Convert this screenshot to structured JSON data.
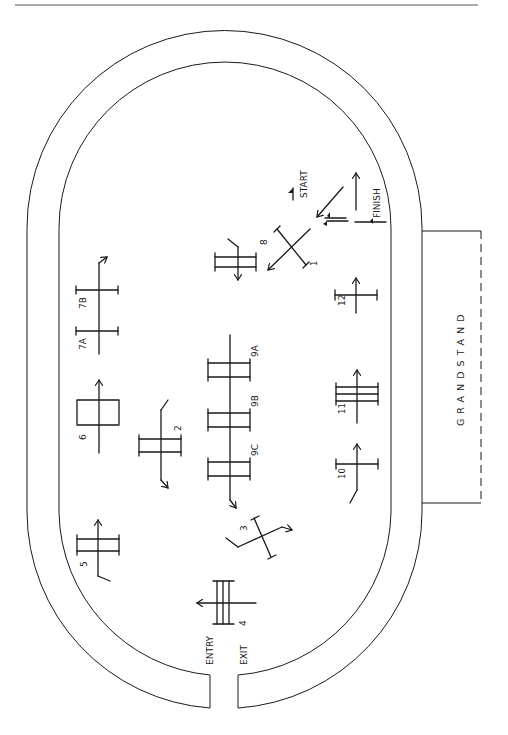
{
  "diagram": {
    "type": "arena-course-plan",
    "features": {
      "grandstand_label": "GRANDSTAND",
      "entry_label": "ENTRY",
      "exit_label": "EXIT",
      "start_label": "START",
      "finish_label": "FINISH"
    },
    "obstacles": [
      {
        "id": "1",
        "label": "1"
      },
      {
        "id": "2",
        "label": "2"
      },
      {
        "id": "3",
        "label": "3"
      },
      {
        "id": "4",
        "label": "4"
      },
      {
        "id": "5",
        "label": "5"
      },
      {
        "id": "6",
        "label": "6"
      },
      {
        "id": "7A",
        "label": "7A"
      },
      {
        "id": "7B",
        "label": "7B"
      },
      {
        "id": "8",
        "label": "8"
      },
      {
        "id": "9A",
        "label": "9A"
      },
      {
        "id": "9B",
        "label": "9B"
      },
      {
        "id": "9C",
        "label": "9C"
      },
      {
        "id": "10",
        "label": "10"
      },
      {
        "id": "11",
        "label": "11"
      },
      {
        "id": "12",
        "label": "12"
      }
    ],
    "colors": {
      "line": "#1a1a1a",
      "background": "#ffffff"
    }
  }
}
